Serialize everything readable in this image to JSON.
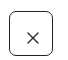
{
  "close_button": {
    "icon": "close-icon",
    "aria_label": "Close",
    "border_color": "#222222",
    "icon_color": "#333333",
    "background": "#ffffff"
  }
}
